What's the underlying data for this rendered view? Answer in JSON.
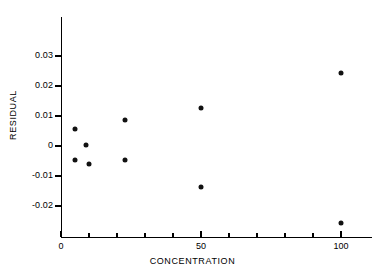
{
  "chart_data": {
    "type": "scatter",
    "title": "",
    "xlabel": "CONCENTRATION",
    "ylabel": "RESIDUAL",
    "xlim": [
      0,
      111
    ],
    "ylim": [
      -0.0303,
      0.0397
    ],
    "grid": false,
    "legend": null,
    "x_ticks": [
      {
        "value": 0,
        "label": "0",
        "major": true
      },
      {
        "value": 10,
        "label": "",
        "major": false
      },
      {
        "value": 20,
        "label": "",
        "major": false
      },
      {
        "value": 30,
        "label": "",
        "major": false
      },
      {
        "value": 40,
        "label": "",
        "major": false
      },
      {
        "value": 50,
        "label": "50",
        "major": true
      },
      {
        "value": 60,
        "label": "",
        "major": false
      },
      {
        "value": 70,
        "label": "",
        "major": false
      },
      {
        "value": 80,
        "label": "",
        "major": false
      },
      {
        "value": 90,
        "label": "",
        "major": false
      },
      {
        "value": 100,
        "label": "100",
        "major": true
      }
    ],
    "y_ticks": [
      {
        "value": 0.03,
        "label": "0.03"
      },
      {
        "value": 0.02,
        "label": "0.02"
      },
      {
        "value": 0.01,
        "label": "0.01"
      },
      {
        "value": 0.0,
        "label": "0"
      },
      {
        "value": -0.01,
        "label": "-0.01"
      },
      {
        "value": -0.02,
        "label": "-0.02"
      }
    ],
    "series": [
      {
        "name": "residuals",
        "marker": "filled-circle",
        "color": "#111111",
        "points": [
          {
            "x": 5,
            "y": 0.0057
          },
          {
            "x": 5,
            "y": -0.0045
          },
          {
            "x": 9,
            "y": 0.0003
          },
          {
            "x": 10,
            "y": -0.0061
          },
          {
            "x": 23,
            "y": 0.0088
          },
          {
            "x": 23,
            "y": -0.0046
          },
          {
            "x": 50,
            "y": 0.0128
          },
          {
            "x": 50,
            "y": -0.0135
          },
          {
            "x": 100,
            "y": 0.0245
          },
          {
            "x": 100,
            "y": -0.0255
          }
        ]
      }
    ]
  },
  "axis_colors": {
    "line": "#000000",
    "marker": "#111111",
    "background": "#ffffff"
  }
}
